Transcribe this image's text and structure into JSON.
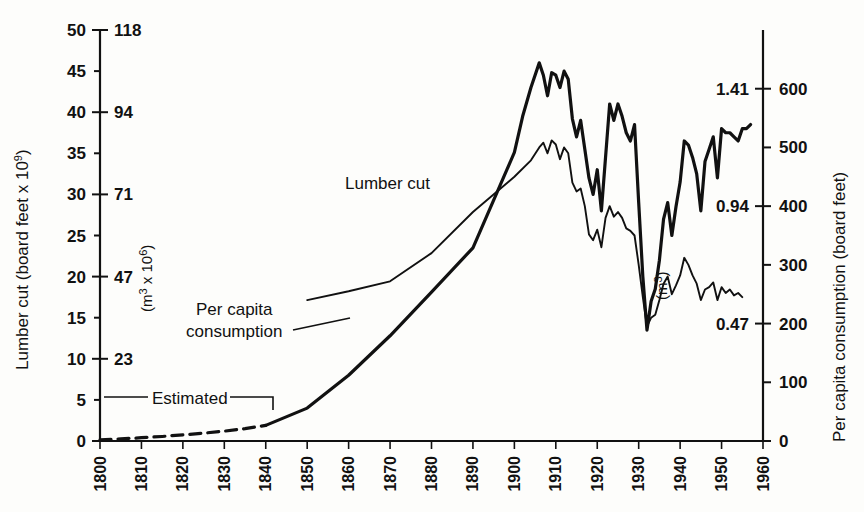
{
  "chart_data": {
    "type": "line",
    "title": "",
    "xlabel": "",
    "grid": false,
    "legend_position": "inline-annotations",
    "xlim": [
      1800,
      1960
    ],
    "x_ticks": [
      1800,
      1810,
      1820,
      1830,
      1840,
      1850,
      1860,
      1870,
      1880,
      1890,
      1900,
      1910,
      1920,
      1930,
      1940,
      1950,
      1960
    ],
    "axes": {
      "left_primary": {
        "label": "Lumber cut (board feet x 10",
        "label_exponent": "9",
        "label_close": ")",
        "ticks": [
          0,
          5,
          10,
          15,
          20,
          25,
          30,
          35,
          40,
          45,
          50
        ],
        "lim": [
          0,
          50
        ]
      },
      "left_secondary": {
        "label": "(m",
        "label_exponent": "3",
        "label_mid": " x 10",
        "label_exponent2": "6",
        "label_close": ")",
        "ticks": [
          23,
          47,
          71,
          94,
          118
        ],
        "tick_at_primary": [
          10,
          20,
          30,
          40,
          50
        ]
      },
      "right_primary": {
        "label": "Per capita consumption (board feet)",
        "ticks": [
          0,
          100,
          200,
          300,
          400,
          500,
          600
        ],
        "lim": [
          0,
          700
        ]
      },
      "right_secondary": {
        "label": "(m",
        "label_exponent": "3",
        "label_close": ")",
        "ticks": [
          0.47,
          0.94,
          1.41
        ],
        "tick_at_primary": [
          200,
          400,
          600
        ]
      }
    },
    "annotations": [
      {
        "name": "lumber-cut-label",
        "text": "Lumber cut",
        "x": 1888,
        "y_axis": "left",
        "y": 37.5
      },
      {
        "name": "per-capita-label-line1",
        "text": "Per capita",
        "x": 1829,
        "y_axis": "left",
        "y": 16.5
      },
      {
        "name": "per-capita-label-line2",
        "text": "consumption",
        "x": 1829,
        "y_axis": "left",
        "y": 14.2
      },
      {
        "name": "estimated-label",
        "text": "Estimated",
        "x": 1821,
        "y_axis": "left",
        "y": 3.2
      }
    ],
    "series": [
      {
        "name": "Lumber cut (estimated)",
        "style": "dashed",
        "axis": "left",
        "x": [
          1800,
          1805,
          1810,
          1815,
          1820,
          1825,
          1830,
          1835,
          1840
        ],
        "values": [
          0.15,
          0.25,
          0.4,
          0.55,
          0.75,
          0.95,
          1.2,
          1.5,
          1.9
        ]
      },
      {
        "name": "Lumber cut",
        "style": "solid-thick",
        "axis": "left",
        "x": [
          1840,
          1850,
          1860,
          1870,
          1880,
          1890,
          1900,
          1902,
          1904,
          1906,
          1907,
          1908,
          1909,
          1910,
          1911,
          1912,
          1913,
          1914,
          1915,
          1916,
          1917,
          1918,
          1919,
          1920,
          1921,
          1922,
          1923,
          1924,
          1925,
          1926,
          1927,
          1928,
          1929,
          1930,
          1931,
          1932,
          1933,
          1934,
          1935,
          1936,
          1937,
          1938,
          1939,
          1940,
          1941,
          1942,
          1943,
          1944,
          1945,
          1946,
          1947,
          1948,
          1949,
          1950,
          1951,
          1952,
          1953,
          1954,
          1955,
          1956,
          1957
        ],
        "values": [
          1.9,
          4.0,
          8.0,
          12.8,
          18.1,
          23.5,
          35.1,
          39.5,
          43.0,
          46.0,
          44.5,
          42.0,
          44.8,
          44.5,
          43.0,
          45.0,
          44.0,
          39.2,
          37.0,
          39.0,
          35.5,
          32.0,
          30.0,
          33.0,
          28.0,
          34.5,
          41.0,
          39.0,
          41.0,
          39.5,
          37.5,
          36.5,
          38.5,
          29.0,
          20.0,
          13.5,
          17.0,
          18.5,
          22.0,
          27.0,
          29.0,
          25.0,
          28.5,
          31.5,
          36.5,
          36.0,
          34.5,
          32.5,
          28.0,
          34.0,
          35.5,
          37.0,
          32.0,
          38.0,
          37.5,
          37.5,
          37.0,
          36.5,
          38.0,
          38.0,
          38.5
        ]
      },
      {
        "name": "Per capita consumption",
        "style": "solid-thin",
        "axis": "right",
        "x": [
          1850,
          1860,
          1870,
          1880,
          1890,
          1900,
          1904,
          1906,
          1907,
          1908,
          1909,
          1910,
          1911,
          1912,
          1913,
          1914,
          1915,
          1916,
          1917,
          1918,
          1919,
          1920,
          1921,
          1922,
          1923,
          1924,
          1925,
          1926,
          1927,
          1928,
          1929,
          1930,
          1931,
          1932,
          1933,
          1934,
          1935,
          1936,
          1937,
          1938,
          1939,
          1940,
          1941,
          1942,
          1943,
          1944,
          1945,
          1946,
          1947,
          1948,
          1949,
          1950,
          1951,
          1952,
          1953,
          1954,
          1955
        ],
        "values": [
          240,
          255,
          272,
          320,
          390,
          450,
          478,
          500,
          508,
          490,
          512,
          505,
          480,
          500,
          490,
          440,
          425,
          430,
          400,
          352,
          342,
          360,
          330,
          380,
          400,
          382,
          390,
          380,
          362,
          358,
          350,
          300,
          245,
          195,
          210,
          215,
          240,
          268,
          280,
          250,
          265,
          282,
          312,
          300,
          282,
          268,
          240,
          258,
          262,
          270,
          240,
          262,
          252,
          258,
          248,
          252,
          245
        ]
      }
    ]
  }
}
